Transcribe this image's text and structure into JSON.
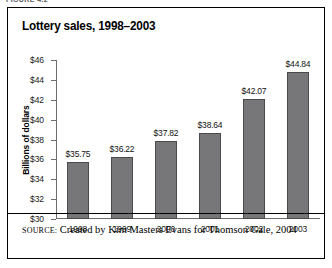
{
  "figure": {
    "caption_partial": "FIGURE 4.2",
    "title": "Lottery sales, 1998–2003",
    "source_label": "SOURCE:",
    "source_text": "Created by Kim Masters Evans for Thomson Gale, 2004",
    "border_color": "#000000",
    "background_color": "#ffffff"
  },
  "chart_data": {
    "type": "bar",
    "title": "Lottery sales, 1998–2003",
    "xlabel": "",
    "ylabel": "Billions of dollars",
    "categories": [
      "1998",
      "1999",
      "2000",
      "2001",
      "2002",
      "2003"
    ],
    "values": [
      35.75,
      36.22,
      37.82,
      38.64,
      42.07,
      44.84
    ],
    "value_labels": [
      "$35.75",
      "$36.22",
      "$37.82",
      "$38.64",
      "$42.07",
      "$44.84"
    ],
    "ylim": [
      30,
      46
    ],
    "ytick_step": 2,
    "ytick_labels": [
      "$46",
      "$44",
      "$42",
      "$40",
      "$38",
      "$36",
      "$34",
      "$32",
      "$30"
    ],
    "ytick_values": [
      46,
      44,
      42,
      40,
      38,
      36,
      34,
      32,
      30
    ],
    "grid": false,
    "legend": false,
    "bar_color": "#77777a",
    "bar_edge_color": "#4a4a4d",
    "axis_color": "#6d6d6d"
  }
}
